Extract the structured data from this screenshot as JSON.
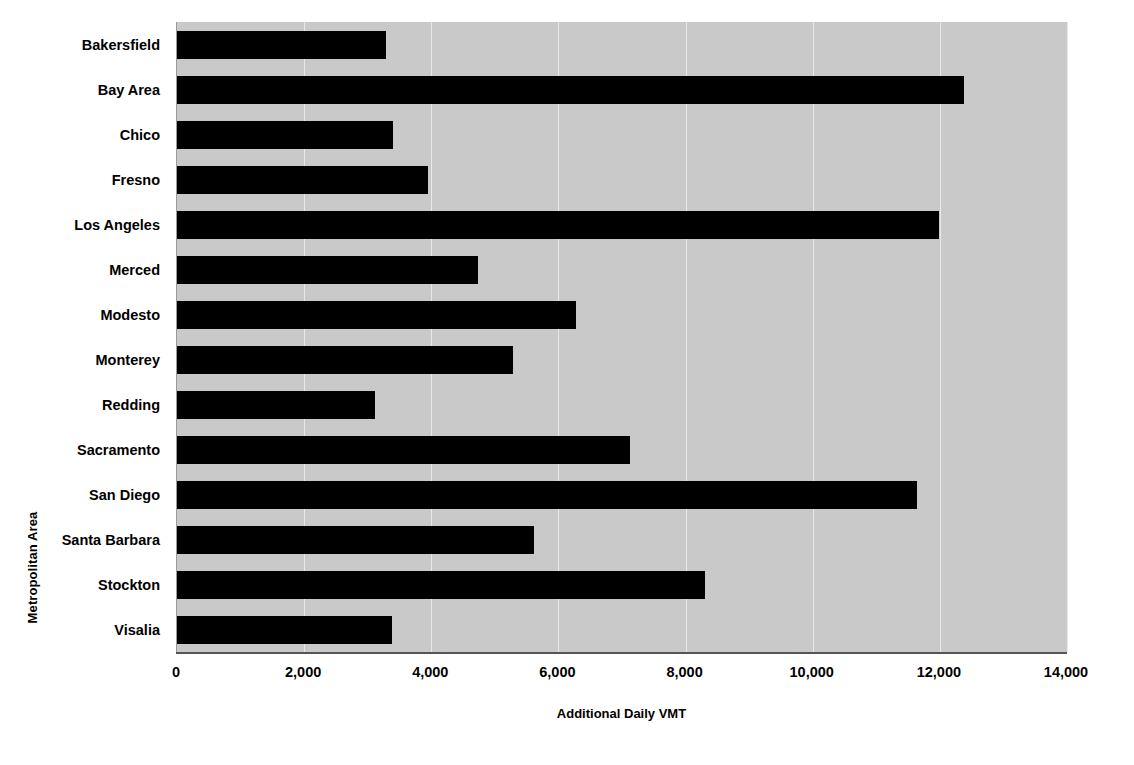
{
  "chart_data": {
    "type": "bar",
    "orientation": "horizontal",
    "title": "",
    "xlabel": "Additional Daily VMT",
    "ylabel": "Metropolitan Area",
    "xlim": [
      0,
      14000
    ],
    "xticks": [
      "0",
      "2,000",
      "4,000",
      "6,000",
      "8,000",
      "10,000",
      "12,000",
      "14,000"
    ],
    "xtick_values": [
      0,
      2000,
      4000,
      6000,
      8000,
      10000,
      12000,
      14000
    ],
    "grid": "vertical-only",
    "legend": "none",
    "bar_color": "#000000",
    "plot_background": "#c9c9c9",
    "categories": [
      "Bakersfield",
      "Bay Area",
      "Chico",
      "Fresno",
      "Los Angeles",
      "Merced",
      "Modesto",
      "Monterey",
      "Redding",
      "Sacramento",
      "San Diego",
      "Santa Barbara",
      "Stockton",
      "Visalia"
    ],
    "values": [
      3280,
      12380,
      3400,
      3950,
      11990,
      4730,
      6280,
      5280,
      3120,
      7120,
      11640,
      5620,
      8310,
      3380
    ]
  }
}
